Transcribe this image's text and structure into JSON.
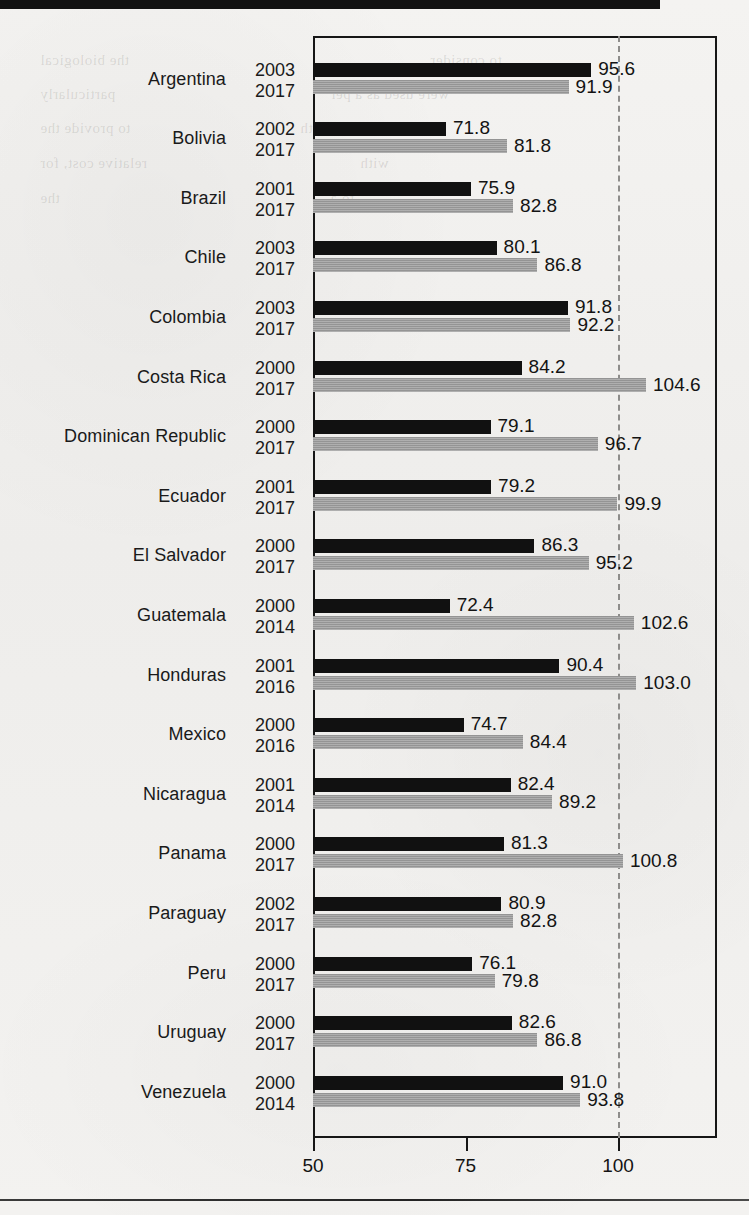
{
  "page": {
    "background_color": "#f2f1ef",
    "top_rule_color": "#121212",
    "bleed_through_lines": [
      "the biological",
      "to consider",
      "particularly",
      "were used as a per",
      "to provide the",
      "a certain value with",
      "relative cost, for",
      "with",
      "the",
      "to a"
    ]
  },
  "chart_data": {
    "type": "bar",
    "orientation": "horizontal",
    "title": "",
    "subtitle": "",
    "xlabel": "",
    "ylabel": "",
    "xlim": [
      50,
      116
    ],
    "xticks": [
      50,
      75,
      100
    ],
    "xtick_labels": [
      "50",
      "75",
      "100"
    ],
    "grid": false,
    "gridline_at": 100,
    "gridline_style": "dashed",
    "legend": [],
    "series": [
      {
        "name": "earlier",
        "color": "#111111"
      },
      {
        "name": "later",
        "color": "#9d9d9d"
      }
    ],
    "categories": [
      "Argentina",
      "Bolivia",
      "Brazil",
      "Chile",
      "Colombia",
      "Costa Rica",
      "Dominican Republic",
      "Ecuador",
      "El Salvador",
      "Guatemala",
      "Honduras",
      "Mexico",
      "Nicaragua",
      "Panama",
      "Paraguay",
      "Peru",
      "Uruguay",
      "Venezuela"
    ],
    "rows": [
      {
        "country": "Argentina",
        "early_year": "2003",
        "early_value": 95.6,
        "early_label": "95.6",
        "late_year": "2017",
        "late_value": 91.9,
        "late_label": "91.9"
      },
      {
        "country": "Bolivia",
        "early_year": "2002",
        "early_value": 71.8,
        "early_label": "71.8",
        "late_year": "2017",
        "late_value": 81.8,
        "late_label": "81.8"
      },
      {
        "country": "Brazil",
        "early_year": "2001",
        "early_value": 75.9,
        "early_label": "75.9",
        "late_year": "2017",
        "late_value": 82.8,
        "late_label": "82.8"
      },
      {
        "country": "Chile",
        "early_year": "2003",
        "early_value": 80.1,
        "early_label": "80.1",
        "late_year": "2017",
        "late_value": 86.8,
        "late_label": "86.8"
      },
      {
        "country": "Colombia",
        "early_year": "2003",
        "early_value": 91.8,
        "early_label": "91.8",
        "late_year": "2017",
        "late_value": 92.2,
        "late_label": "92.2"
      },
      {
        "country": "Costa Rica",
        "early_year": "2000",
        "early_value": 84.2,
        "early_label": "84.2",
        "late_year": "2017",
        "late_value": 104.6,
        "late_label": "104.6"
      },
      {
        "country": "Dominican Republic",
        "early_year": "2000",
        "early_value": 79.1,
        "early_label": "79.1",
        "late_year": "2017",
        "late_value": 96.7,
        "late_label": "96.7"
      },
      {
        "country": "Ecuador",
        "early_year": "2001",
        "early_value": 79.2,
        "early_label": "79.2",
        "late_year": "2017",
        "late_value": 99.9,
        "late_label": "99.9"
      },
      {
        "country": "El Salvador",
        "early_year": "2000",
        "early_value": 86.3,
        "early_label": "86.3",
        "late_year": "2017",
        "late_value": 95.2,
        "late_label": "95.2"
      },
      {
        "country": "Guatemala",
        "early_year": "2000",
        "early_value": 72.4,
        "early_label": "72.4",
        "late_year": "2014",
        "late_value": 102.6,
        "late_label": "102.6"
      },
      {
        "country": "Honduras",
        "early_year": "2001",
        "early_value": 90.4,
        "early_label": "90.4",
        "late_year": "2016",
        "late_value": 103.0,
        "late_label": "103.0"
      },
      {
        "country": "Mexico",
        "early_year": "2000",
        "early_value": 74.7,
        "early_label": "74.7",
        "late_year": "2016",
        "late_value": 84.4,
        "late_label": "84.4"
      },
      {
        "country": "Nicaragua",
        "early_year": "2001",
        "early_value": 82.4,
        "early_label": "82.4",
        "late_year": "2014",
        "late_value": 89.2,
        "late_label": "89.2"
      },
      {
        "country": "Panama",
        "early_year": "2000",
        "early_value": 81.3,
        "early_label": "81.3",
        "late_year": "2017",
        "late_value": 100.8,
        "late_label": "100.8"
      },
      {
        "country": "Paraguay",
        "early_year": "2002",
        "early_value": 80.9,
        "early_label": "80.9",
        "late_year": "2017",
        "late_value": 82.8,
        "late_label": "82.8"
      },
      {
        "country": "Peru",
        "early_year": "2000",
        "early_value": 76.1,
        "early_label": "76.1",
        "late_year": "2017",
        "late_value": 79.8,
        "late_label": "79.8"
      },
      {
        "country": "Uruguay",
        "early_year": "2000",
        "early_value": 82.6,
        "early_label": "82.6",
        "late_year": "2017",
        "late_value": 86.8,
        "late_label": "86.8"
      },
      {
        "country": "Venezuela",
        "early_year": "2000",
        "early_value": 91.0,
        "early_label": "91.0",
        "late_year": "2014",
        "late_value": 93.8,
        "late_label": "93.8"
      }
    ]
  }
}
